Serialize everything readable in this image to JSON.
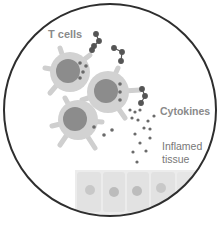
{
  "diagram": {
    "labels": {
      "t_cells": "T cells",
      "cytokines": "Cytokines",
      "inflamed_line1": "Inflamed",
      "inflamed_line2": "tissue"
    },
    "colors": {
      "circle_outline": "#333333",
      "cell_body": "#cfcfcf",
      "nucleus": "#8a8a8a",
      "cytokine_dot": "#666666",
      "tissue": "#e4e4e4"
    }
  }
}
